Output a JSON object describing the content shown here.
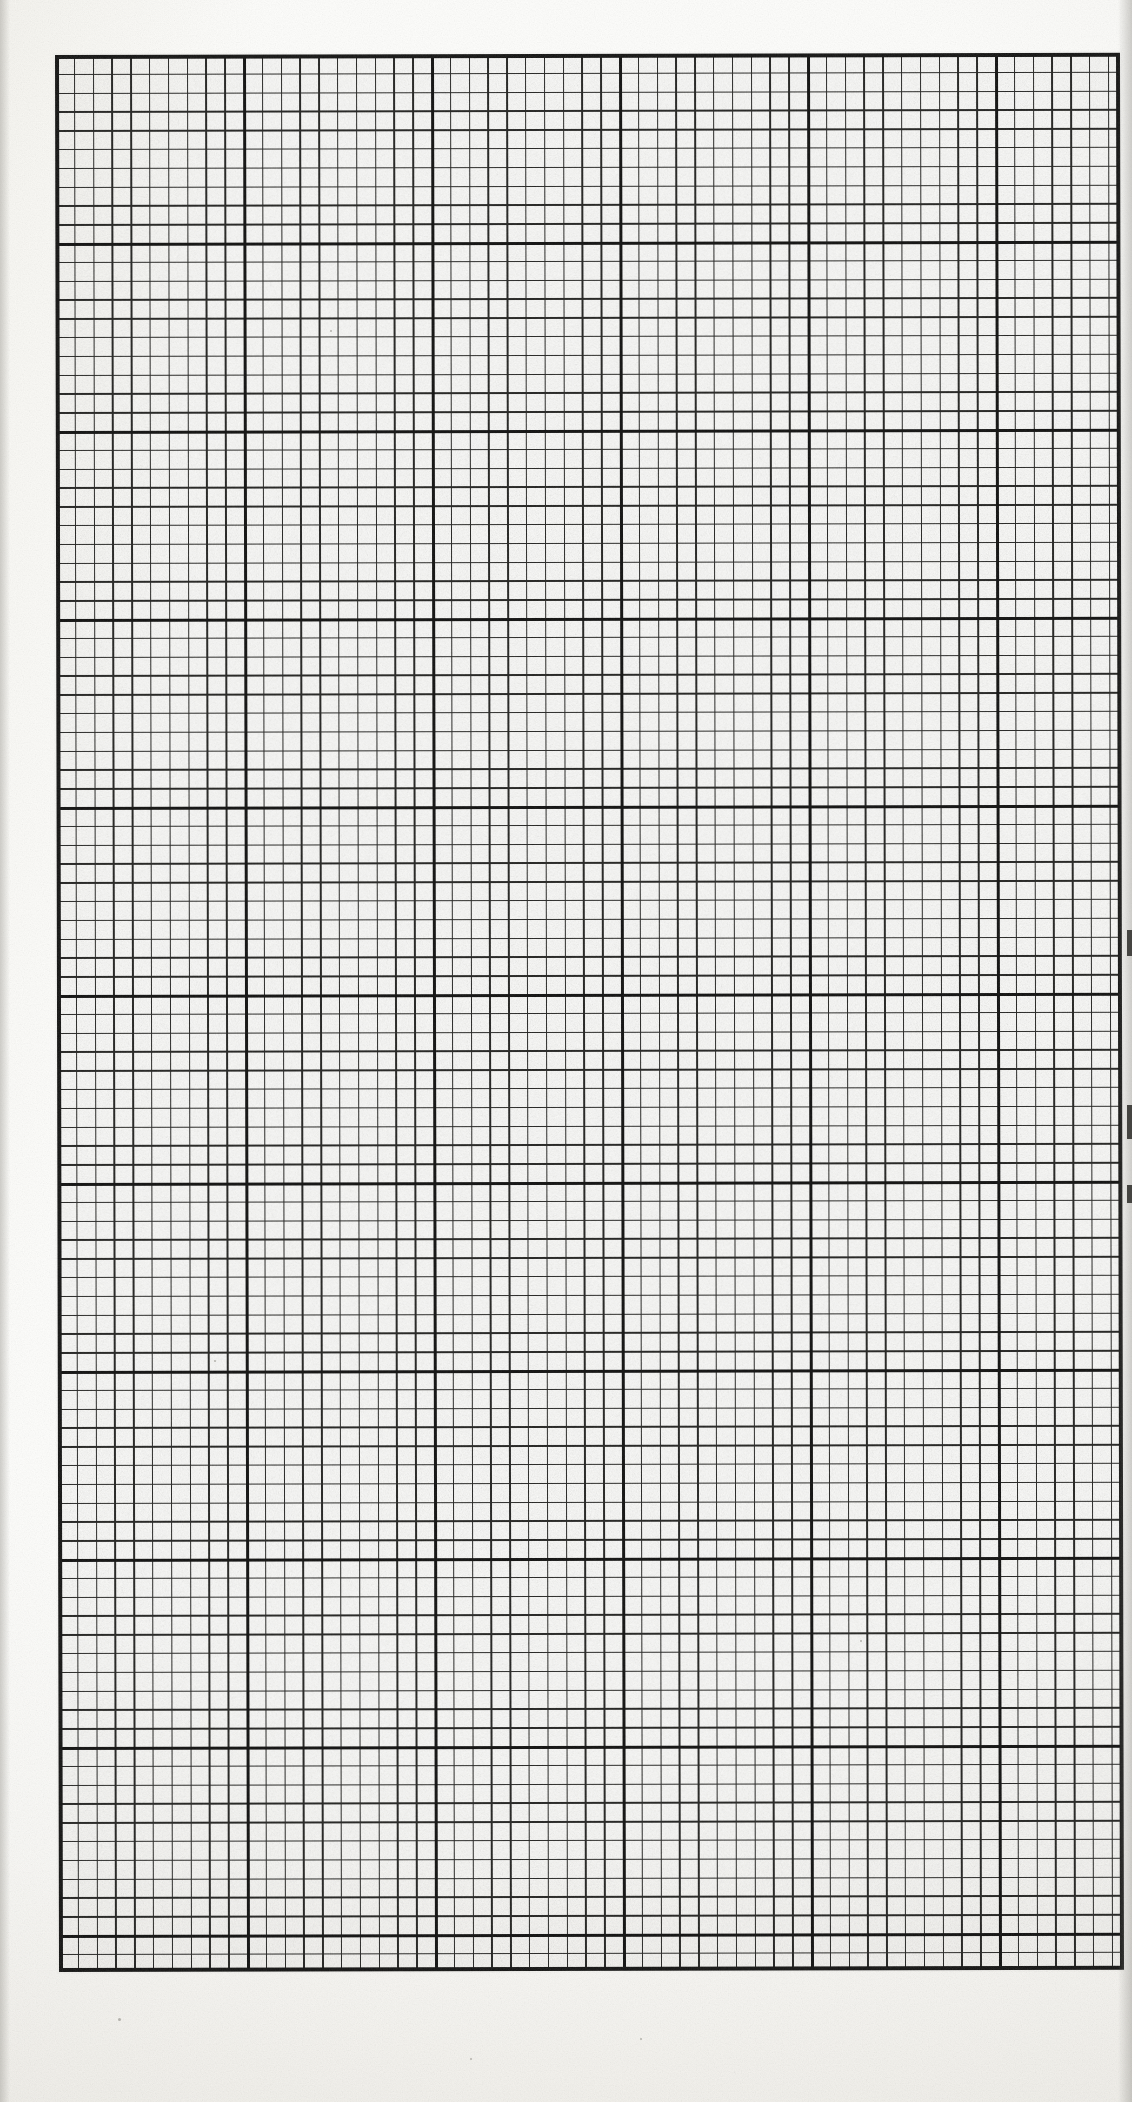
{
  "document": {
    "kind": "scanned-graph-paper",
    "page_width_px": 1132,
    "page_height_px": 2102,
    "paper_color": "#fdfdfb",
    "ink_color": "#1a1a18",
    "caption": "Blank sheet of engineering graph paper (scanned)"
  },
  "grid": {
    "label": "graph-paper-grid",
    "origin_x_px": 55,
    "origin_y_px": 55,
    "width_px": 1065,
    "height_px": 1917,
    "minor_cell_px": 18.8,
    "major_every_n_cells": 10,
    "minor_columns": 56,
    "minor_rows": 102,
    "major_columns": 6,
    "major_rows": 11,
    "minor_line_color": "#20201e",
    "minor_line_width_px": 1.5,
    "major_line_color": "#0d0d0c",
    "major_line_width_px": 3,
    "border_color": "#111110",
    "border_width_px": 4,
    "skew_deg": -0.12
  },
  "scan_artifacts": {
    "left_edge_shadow": true,
    "right_edge_shadow": true,
    "paper_grain": true,
    "edge_nicks": [
      {
        "top_px": 930,
        "height_px": 26
      },
      {
        "top_px": 1105,
        "height_px": 34
      },
      {
        "top_px": 1185,
        "height_px": 18
      }
    ],
    "specks": [
      {
        "x_px": 118,
        "y_px": 2018,
        "size_px": 3
      },
      {
        "x_px": 640,
        "y_px": 2038,
        "size_px": 2
      },
      {
        "x_px": 214,
        "y_px": 1360,
        "size_px": 2
      },
      {
        "x_px": 330,
        "y_px": 330,
        "size_px": 2
      },
      {
        "x_px": 860,
        "y_px": 1640,
        "size_px": 2
      },
      {
        "x_px": 470,
        "y_px": 2058,
        "size_px": 2
      }
    ]
  }
}
